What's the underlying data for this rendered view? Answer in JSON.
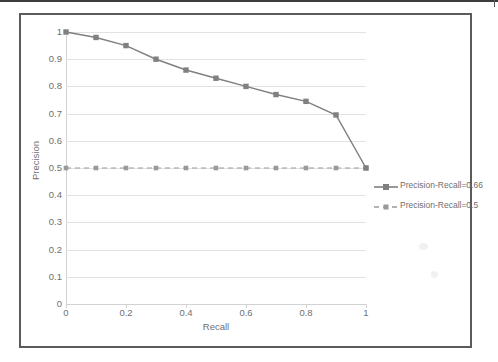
{
  "page": {
    "background_color": "#ffffff",
    "top_rule_color": "#3c3c3c"
  },
  "chart_frame": {
    "border_color": "#5b5b5b",
    "background_color": "#ffffff"
  },
  "chart_data": {
    "type": "line",
    "title": "",
    "subtitle": "",
    "xlabel": "Recall",
    "ylabel": "Precision",
    "xlim": [
      0,
      1
    ],
    "ylim": [
      0,
      1
    ],
    "grid": true,
    "grid_axis": "y",
    "legend_position": "right",
    "x": [
      0,
      0.1,
      0.2,
      0.3,
      0.4,
      0.5,
      0.6,
      0.7,
      0.8,
      0.9,
      1
    ],
    "xticks": [
      0,
      0.2,
      0.4,
      0.6,
      0.8,
      1
    ],
    "xtick_labels": [
      "0",
      "0.2",
      "0.4",
      "0.6",
      "0.8",
      "1"
    ],
    "yticks": [
      0,
      0.1,
      0.2,
      0.3,
      0.4,
      0.5,
      0.6,
      0.7,
      0.8,
      0.9,
      1
    ],
    "ytick_labels": [
      "0",
      "0.1",
      "0.2",
      "0.3",
      "0.4",
      "0.5",
      "0.6",
      "0.7",
      "0.8",
      "0.9",
      "1"
    ],
    "series": [
      {
        "name": "Precision-Recall=0.66",
        "style": "solid",
        "color": "#808080",
        "marker": "square",
        "values": [
          1.0,
          0.98,
          0.95,
          0.9,
          0.86,
          0.83,
          0.8,
          0.77,
          0.745,
          0.695,
          0.5
        ]
      },
      {
        "name": "Precision-Recall=0.5",
        "style": "dashed",
        "color": "#9a9a9a",
        "marker": "square",
        "values": [
          0.5,
          0.5,
          0.5,
          0.5,
          0.5,
          0.5,
          0.5,
          0.5,
          0.5,
          0.5,
          0.5
        ]
      }
    ]
  },
  "legend": {
    "entries": [
      {
        "label": "Precision-Recall=0.66",
        "style": "solid"
      },
      {
        "label": "Precision-Recall=0.5",
        "style": "dashed"
      }
    ]
  },
  "axes": {
    "x_title": "Recall",
    "y_title": "Precision"
  }
}
